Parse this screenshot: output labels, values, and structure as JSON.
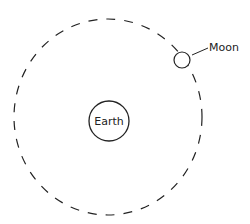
{
  "diagram": {
    "type": "orbit-diagram",
    "colors": {
      "background": "#ffffff",
      "stroke": "#222222"
    },
    "orbit": {
      "style": "dashed",
      "cx": 108,
      "cy": 117,
      "rx": 94,
      "ry": 98
    },
    "earth": {
      "label": "Earth",
      "cx": 109,
      "cy": 121,
      "r": 20
    },
    "moon": {
      "label": "Moon",
      "cx": 182,
      "cy": 60,
      "r": 8
    }
  }
}
